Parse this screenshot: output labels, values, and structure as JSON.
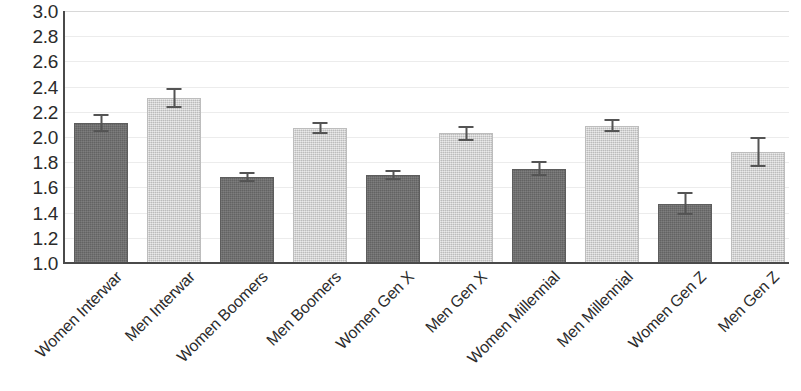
{
  "chart_data": {
    "type": "bar",
    "title": "",
    "subtitle": "",
    "xlabel": "",
    "ylabel": "",
    "ylim": [
      1.0,
      3.0
    ],
    "ytick_step": 0.2,
    "grid": true,
    "legend": "none",
    "orientation": "vertical",
    "yticks": [
      "3.0",
      "2.8",
      "2.6",
      "2.4",
      "2.2",
      "2.0",
      "1.8",
      "1.6",
      "1.4",
      "1.2",
      "1.0"
    ],
    "categories": [
      "Women Interwar",
      "Men Interwar",
      "Women Boomers",
      "Men Boomers",
      "Women Gen X",
      "Men Gen X",
      "Women Millennial",
      "Men Millennial",
      "Women Gen Z",
      "Men Gen Z"
    ],
    "values": [
      2.11,
      2.31,
      1.68,
      2.07,
      1.7,
      2.03,
      1.75,
      2.09,
      1.47,
      1.88
    ],
    "errors": [
      0.07,
      0.08,
      0.04,
      0.05,
      0.04,
      0.06,
      0.06,
      0.05,
      0.09,
      0.12
    ],
    "bar_series": [
      "women",
      "men",
      "women",
      "men",
      "women",
      "men",
      "women",
      "men",
      "women",
      "men"
    ],
    "colors": {
      "women_bar": "#6f6f6f",
      "men_bar": "#d2d2d2",
      "error_bar": "#545454",
      "axis": "#4a4a4a",
      "gridline": "#ececec",
      "text": "#2b2b2b",
      "background": "#ffffff"
    }
  }
}
